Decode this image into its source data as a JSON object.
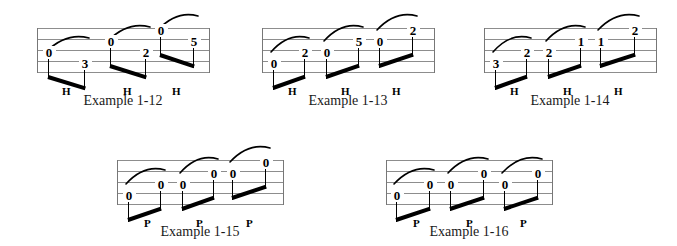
{
  "page": {
    "width": 677,
    "height": 246,
    "background": "#ffffff",
    "ink_color": "#000000",
    "staff_line_color": "#8d8d8d"
  },
  "examples": [
    {
      "id": "example-1-12",
      "caption": "Example 1-12",
      "technique": "hammer-on",
      "technique_marker": "H",
      "staff": {
        "x": 37,
        "y": 28,
        "width": 172,
        "height": 46,
        "lines": 5
      },
      "caption_box": {
        "x": 32,
        "y": 93,
        "width": 182
      },
      "notes": [
        {
          "label": "0",
          "x": 48,
          "string": 3,
          "pair": 1,
          "role": "start"
        },
        {
          "label": "3",
          "x": 84,
          "string": 4,
          "pair": 1,
          "role": "end"
        },
        {
          "label": "0",
          "x": 110,
          "string": 2,
          "pair": 2,
          "role": "start"
        },
        {
          "label": "2",
          "x": 145,
          "string": 3,
          "pair": 2,
          "role": "end"
        },
        {
          "label": "0",
          "x": 160,
          "string": 1,
          "pair": 3,
          "role": "start"
        },
        {
          "label": "5",
          "x": 193,
          "string": 2,
          "pair": 3,
          "role": "end"
        }
      ],
      "markers": [
        {
          "label": "H",
          "x": 66
        },
        {
          "label": "H",
          "x": 127
        },
        {
          "label": "H",
          "x": 176
        }
      ]
    },
    {
      "id": "example-1-13",
      "caption": "Example 1-13",
      "technique": "hammer-on",
      "technique_marker": "H",
      "staff": {
        "x": 262,
        "y": 28,
        "width": 172,
        "height": 46,
        "lines": 5
      },
      "caption_box": {
        "x": 257,
        "y": 93,
        "width": 182
      },
      "notes": [
        {
          "label": "0",
          "x": 273,
          "string": 4,
          "pair": 1,
          "role": "start"
        },
        {
          "label": "2",
          "x": 304,
          "string": 3,
          "pair": 1,
          "role": "end"
        },
        {
          "label": "0",
          "x": 326,
          "string": 3,
          "pair": 2,
          "role": "start"
        },
        {
          "label": "5",
          "x": 358,
          "string": 2,
          "pair": 2,
          "role": "end"
        },
        {
          "label": "0",
          "x": 379,
          "string": 2,
          "pair": 3,
          "role": "start"
        },
        {
          "label": "2",
          "x": 412,
          "string": 1,
          "pair": 3,
          "role": "end"
        }
      ],
      "markers": [
        {
          "label": "H",
          "x": 292
        },
        {
          "label": "H",
          "x": 345
        },
        {
          "label": "H",
          "x": 396
        }
      ]
    },
    {
      "id": "example-1-14",
      "caption": "Example 1-14",
      "technique": "hammer-on",
      "technique_marker": "H",
      "staff": {
        "x": 484,
        "y": 28,
        "width": 172,
        "height": 46,
        "lines": 5
      },
      "caption_box": {
        "x": 479,
        "y": 93,
        "width": 182
      },
      "notes": [
        {
          "label": "3",
          "x": 495,
          "string": 4,
          "pair": 1,
          "role": "start"
        },
        {
          "label": "2",
          "x": 526,
          "string": 3,
          "pair": 1,
          "role": "end"
        },
        {
          "label": "2",
          "x": 548,
          "string": 3,
          "pair": 2,
          "role": "start"
        },
        {
          "label": "1",
          "x": 580,
          "string": 2,
          "pair": 2,
          "role": "end"
        },
        {
          "label": "1",
          "x": 600,
          "string": 2,
          "pair": 3,
          "role": "start"
        },
        {
          "label": "2",
          "x": 634,
          "string": 1,
          "pair": 3,
          "role": "end"
        }
      ],
      "markers": [
        {
          "label": "H",
          "x": 514
        },
        {
          "label": "H",
          "x": 567
        },
        {
          "label": "H",
          "x": 618
        }
      ]
    },
    {
      "id": "example-1-15",
      "caption": "Example 1-15",
      "technique": "pull-off",
      "technique_marker": "P",
      "staff": {
        "x": 117,
        "y": 160,
        "width": 166,
        "height": 46,
        "lines": 5
      },
      "caption_box": {
        "x": 112,
        "y": 224,
        "width": 176
      },
      "notes": [
        {
          "label": "0",
          "x": 128,
          "string": 4,
          "pair": 1,
          "role": "start"
        },
        {
          "label": "0",
          "x": 160,
          "string": 3,
          "pair": 1,
          "role": "end"
        },
        {
          "label": "0",
          "x": 182,
          "string": 3,
          "pair": 2,
          "role": "start"
        },
        {
          "label": "0",
          "x": 213,
          "string": 2,
          "pair": 2,
          "role": "end"
        },
        {
          "label": "0",
          "x": 232,
          "string": 2,
          "pair": 3,
          "role": "start"
        },
        {
          "label": "0",
          "x": 265,
          "string": 1,
          "pair": 3,
          "role": "end"
        }
      ],
      "markers": [
        {
          "label": "P",
          "x": 148
        },
        {
          "label": "P",
          "x": 200
        },
        {
          "label": "P",
          "x": 250
        }
      ]
    },
    {
      "id": "example-1-16",
      "caption": "Example 1-16",
      "technique": "pull-off",
      "technique_marker": "P",
      "staff": {
        "x": 386,
        "y": 160,
        "width": 166,
        "height": 46,
        "lines": 5
      },
      "caption_box": {
        "x": 381,
        "y": 224,
        "width": 176
      },
      "notes": [
        {
          "label": "0",
          "x": 396,
          "string": 4,
          "pair": 1,
          "role": "start"
        },
        {
          "label": "0",
          "x": 429,
          "string": 3,
          "pair": 1,
          "role": "end"
        },
        {
          "label": "0",
          "x": 450,
          "string": 3,
          "pair": 2,
          "role": "start"
        },
        {
          "label": "0",
          "x": 483,
          "string": 2,
          "pair": 2,
          "role": "end"
        },
        {
          "label": "0",
          "x": 504,
          "string": 3,
          "pair": 3,
          "role": "start"
        },
        {
          "label": "0",
          "x": 537,
          "string": 2,
          "pair": 3,
          "role": "end"
        }
      ],
      "markers": [
        {
          "label": "P",
          "x": 417
        },
        {
          "label": "P",
          "x": 470
        },
        {
          "label": "P",
          "x": 524
        }
      ]
    }
  ]
}
